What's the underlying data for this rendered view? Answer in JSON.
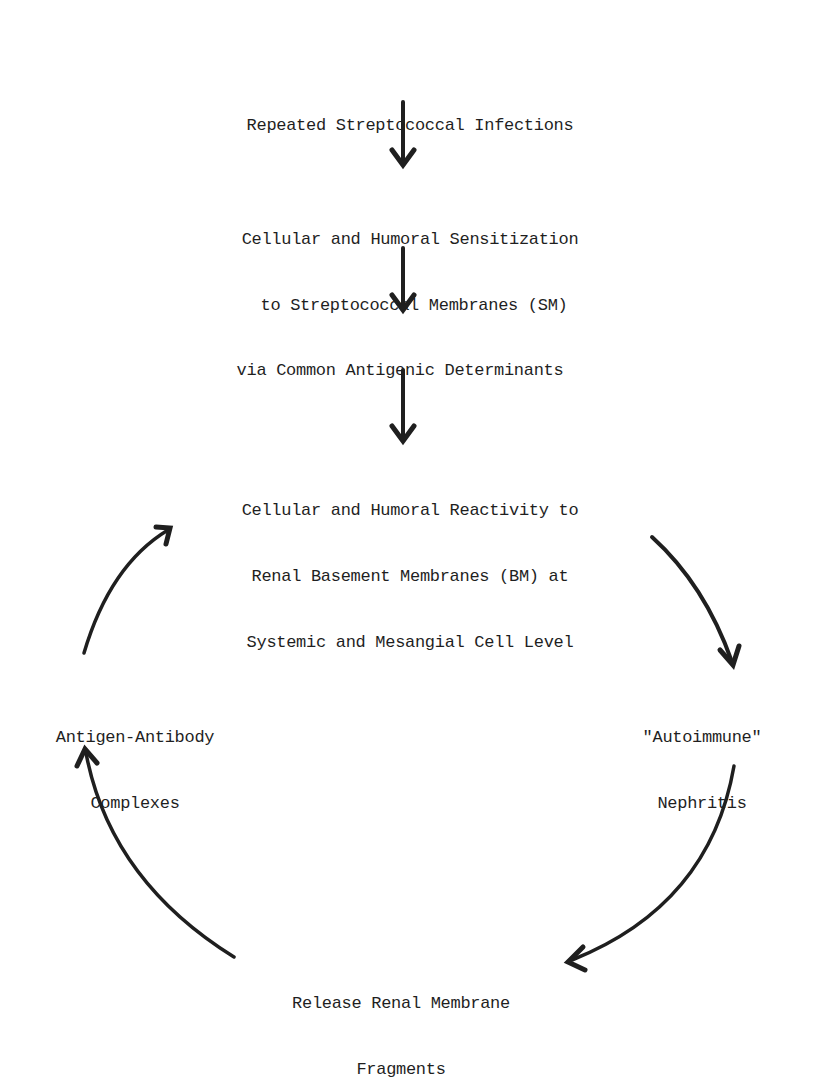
{
  "diagram": {
    "type": "flow-cycle",
    "nodes": {
      "n1": {
        "lines": [
          "Repeated Streptococcal Infections"
        ]
      },
      "n2": {
        "lines": [
          "Cellular and Humoral Sensitization",
          "to Streptococcal Membranes (SM)"
        ]
      },
      "n3": {
        "lines": [
          "via Common Antigenic Determinants"
        ]
      },
      "n4": {
        "lines": [
          "Cellular and Humoral Reactivity to",
          "Renal Basement Membranes (BM) at",
          "Systemic and Mesangial Cell Level"
        ]
      },
      "n5": {
        "lines": [
          "\"Autoimmune\"",
          "Nephritis"
        ]
      },
      "n6": {
        "lines": [
          "Release Renal Membrane",
          "Fragments"
        ]
      },
      "n7": {
        "lines": [
          "Antigen-Antibody",
          "Complexes"
        ]
      }
    },
    "edges": [
      {
        "from": "n1",
        "to": "n2",
        "style": "straight-down"
      },
      {
        "from": "n2",
        "to": "n3",
        "style": "straight-down"
      },
      {
        "from": "n3",
        "to": "n4",
        "style": "straight-down"
      },
      {
        "from": "n4",
        "to": "n5",
        "style": "curved"
      },
      {
        "from": "n5",
        "to": "n6",
        "style": "curved"
      },
      {
        "from": "n6",
        "to": "n7",
        "style": "curved"
      },
      {
        "from": "n7",
        "to": "n4",
        "style": "curved"
      }
    ],
    "colors": {
      "ink": "#1f1f1f",
      "background": "#ffffff"
    }
  }
}
